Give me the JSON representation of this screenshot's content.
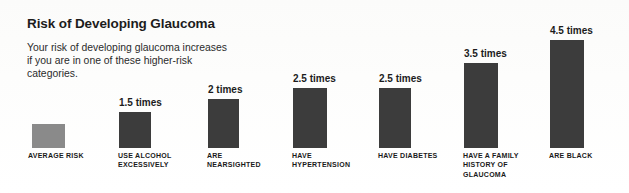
{
  "title": "Risk of Developing Glaucoma",
  "description": "Your risk of developing glaucoma increases if you are in one of these higher-risk categories.",
  "colors": {
    "background": "#ffffff",
    "bar_default": "#3c3c3c",
    "bar_average": "#8a8a8a",
    "text": "#1c1c1c"
  },
  "chart_data": {
    "type": "bar",
    "title": "Risk of Developing Glaucoma",
    "subtitle": "Your risk of developing glaucoma increases if you are in one of these higher-risk categories.",
    "xlabel": "",
    "ylabel": "",
    "ylim": [
      0,
      4.5
    ],
    "grid": false,
    "legend": "none",
    "unit": "times",
    "categories": [
      "AVERAGE RISK",
      "USE ALCOHOL EXCESSIVELY",
      "ARE NEARSIGHTED",
      "HAVE HYPERTENSION",
      "HAVE DIABETES",
      "HAVE A FAMILY HISTORY OF GLAUCOMA",
      "ARE BLACK"
    ],
    "values": [
      1,
      1.5,
      2,
      2.5,
      2.5,
      3.5,
      4.5
    ],
    "value_labels": [
      "",
      "1.5 times",
      "2 times",
      "2.5 times",
      "2.5 times",
      "3.5 times",
      "4.5 times"
    ]
  },
  "bars": [
    {
      "label": "AVERAGE RISK",
      "label_lines": "AVERAGE RISK",
      "value": 1,
      "value_label": "",
      "x": 32,
      "width": 33,
      "height": 24,
      "label_x": 28,
      "label_width": 78,
      "light": true
    },
    {
      "label": "USE ALCOHOL EXCESSIVELY",
      "label_lines": "USE ALCOHOL EXCESSIVELY",
      "value": 1.5,
      "value_label": "1.5 times",
      "x": 119,
      "width": 32,
      "height": 36,
      "label_x": 118,
      "label_width": 62,
      "light": false
    },
    {
      "label": "ARE NEARSIGHTED",
      "label_lines": "ARE NEARSIGHTED",
      "value": 2,
      "value_label": "2 times",
      "x": 208,
      "width": 31,
      "height": 49,
      "label_x": 207,
      "label_width": 62,
      "light": false
    },
    {
      "label": "HAVE HYPERTENSION",
      "label_lines": "HAVE HYPERTENSION",
      "value": 2.5,
      "value_label": "2.5 times",
      "x": 293,
      "width": 34,
      "height": 60,
      "label_x": 292,
      "label_width": 62,
      "light": false
    },
    {
      "label": "HAVE DIABETES",
      "label_lines": "HAVE DIABETES",
      "value": 2.5,
      "value_label": "2.5 times",
      "x": 379,
      "width": 32,
      "height": 60,
      "label_x": 378,
      "label_width": 80,
      "light": false
    },
    {
      "label": "HAVE A FAMILY HISTORY OF GLAUCOMA",
      "label_lines": "HAVE A FAMILY HISTORY OF GLAUCOMA",
      "value": 3.5,
      "value_label": "3.5 times",
      "x": 464,
      "width": 34,
      "height": 85,
      "label_x": 463,
      "label_width": 68,
      "light": false
    },
    {
      "label": "ARE BLACK",
      "label_lines": "ARE BLACK",
      "value": 4.5,
      "value_label": "4.5 times",
      "x": 550,
      "width": 34,
      "height": 108,
      "label_x": 549,
      "label_width": 70,
      "light": false
    }
  ]
}
